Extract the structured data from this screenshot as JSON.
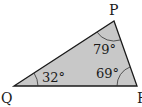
{
  "diagram": {
    "type": "triangle",
    "fill_color": "#c8c8c8",
    "stroke_color": "#1a1a1a",
    "vertices": {
      "P": {
        "label": "P",
        "angle": "79°"
      },
      "Q": {
        "label": "Q",
        "angle": "32°"
      },
      "R": {
        "label": "R",
        "angle": "69°"
      }
    }
  }
}
